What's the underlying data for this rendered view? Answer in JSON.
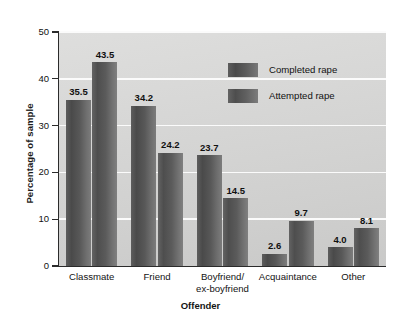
{
  "chart_data": {
    "type": "bar",
    "title": "",
    "xlabel": "Offender",
    "ylabel": "Percentage of sample",
    "categories": [
      "Classmate",
      "Friend",
      "Boyfriend/\nex-boyfriend",
      "Acquaintance",
      "Other"
    ],
    "category_lines": [
      [
        "Classmate"
      ],
      [
        "Friend"
      ],
      [
        "Boyfriend/",
        "ex-boyfriend"
      ],
      [
        "Acquaintance"
      ],
      [
        "Other"
      ]
    ],
    "series": [
      {
        "name": "Completed rape",
        "values": [
          35.5,
          34.2,
          23.7,
          2.6,
          4.0
        ],
        "labels": [
          "35.5",
          "34.2",
          "23.7",
          "2.6",
          "4.0"
        ]
      },
      {
        "name": "Attempted rape",
        "values": [
          43.5,
          24.2,
          14.5,
          9.7,
          8.1
        ],
        "labels": [
          "43.5",
          "24.2",
          "14.5",
          "9.7",
          "8.1"
        ]
      }
    ],
    "ylim": [
      0,
      50
    ],
    "yticks": [
      0,
      10,
      20,
      30,
      40,
      50
    ],
    "ytick_labels": [
      "0",
      "10",
      "20",
      "30",
      "40",
      "50"
    ],
    "grid": true,
    "grid_axis": "y",
    "legend_position": "upper right inside",
    "colors": {
      "completed": "#4a4a4a",
      "attempted": "#5b5b5b",
      "plot_background": "#d6d6d5",
      "gridline": "#fbfbfb",
      "axis": "#2b2b2b",
      "text": "#111111",
      "page_background": "#ffffff"
    }
  },
  "axes": {
    "y_title": "Percentage of sample",
    "x_title": "Offender",
    "y_ticks": [
      {
        "label": "50",
        "value": 50
      },
      {
        "label": "40",
        "value": 40
      },
      {
        "label": "30",
        "value": 30
      },
      {
        "label": "20",
        "value": 20
      },
      {
        "label": "10",
        "value": 10
      },
      {
        "label": "0",
        "value": 0
      }
    ]
  },
  "legend": {
    "items": [
      {
        "label": "Completed rape",
        "swatch": "completed"
      },
      {
        "label": "Attempted rape",
        "swatch": "attempted"
      }
    ]
  },
  "groups": [
    {
      "name": "Classmate",
      "lines": [
        "Classmate"
      ],
      "bars": [
        {
          "series": "Completed rape",
          "value": 35.5,
          "label": "35.5"
        },
        {
          "series": "Attempted rape",
          "value": 43.5,
          "label": "43.5"
        }
      ]
    },
    {
      "name": "Friend",
      "lines": [
        "Friend"
      ],
      "bars": [
        {
          "series": "Completed rape",
          "value": 34.2,
          "label": "34.2"
        },
        {
          "series": "Attempted rape",
          "value": 24.2,
          "label": "24.2"
        }
      ]
    },
    {
      "name": "Boyfriend/ex-boyfriend",
      "lines": [
        "Boyfriend/",
        "ex-boyfriend"
      ],
      "bars": [
        {
          "series": "Completed rape",
          "value": 23.7,
          "label": "23.7"
        },
        {
          "series": "Attempted rape",
          "value": 14.5,
          "label": "14.5"
        }
      ]
    },
    {
      "name": "Acquaintance",
      "lines": [
        "Acquaintance"
      ],
      "bars": [
        {
          "series": "Completed rape",
          "value": 2.6,
          "label": "2.6"
        },
        {
          "series": "Attempted rape",
          "value": 9.7,
          "label": "9.7"
        }
      ]
    },
    {
      "name": "Other",
      "lines": [
        "Other"
      ],
      "bars": [
        {
          "series": "Completed rape",
          "value": 4.0,
          "label": "4.0"
        },
        {
          "series": "Attempted rape",
          "value": 8.1,
          "label": "8.1"
        }
      ]
    }
  ]
}
